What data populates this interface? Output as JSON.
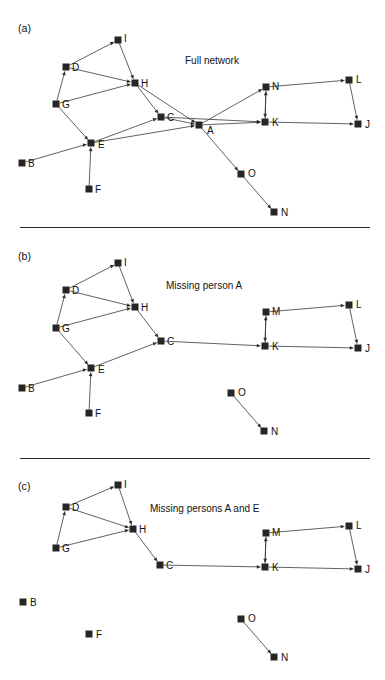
{
  "figure": {
    "width": 385,
    "height": 680,
    "background": "#ffffff",
    "ink_color": "#262626",
    "edge_color": "#2d2d2d"
  },
  "dividers": [
    {
      "name": "divider-a-b",
      "x": 20,
      "y": 227,
      "width": 350
    },
    {
      "name": "divider-b-c",
      "x": 20,
      "y": 458,
      "width": 350
    }
  ],
  "panels": [
    {
      "id": "a",
      "label": "(a)",
      "title": "Full network",
      "label_x": 18,
      "label_y": 22,
      "title_x": 185,
      "title_y": 55,
      "origin_y": 0,
      "nodes": [
        {
          "id": "I",
          "label": "I",
          "x": 118,
          "y": 40,
          "lx": 124,
          "ly": 39
        },
        {
          "id": "D",
          "label": "D",
          "x": 66,
          "y": 67,
          "lx": 72,
          "ly": 68
        },
        {
          "id": "H",
          "label": "H",
          "x": 135,
          "y": 83,
          "lx": 141,
          "ly": 84
        },
        {
          "id": "G",
          "label": "G",
          "x": 56,
          "y": 104,
          "lx": 62,
          "ly": 105
        },
        {
          "id": "C",
          "label": "C",
          "x": 161,
          "y": 117,
          "lx": 167,
          "ly": 118
        },
        {
          "id": "A",
          "label": "A",
          "x": 199,
          "y": 125,
          "lx": 207,
          "ly": 131
        },
        {
          "id": "N1",
          "label": "N",
          "x": 266,
          "y": 87,
          "lx": 272,
          "ly": 87
        },
        {
          "id": "K",
          "label": "K",
          "x": 265,
          "y": 122,
          "lx": 272,
          "ly": 123
        },
        {
          "id": "L",
          "label": "L",
          "x": 349,
          "y": 80,
          "lx": 356,
          "ly": 80
        },
        {
          "id": "J",
          "label": "J",
          "x": 358,
          "y": 124,
          "lx": 365,
          "ly": 125
        },
        {
          "id": "E",
          "label": "E",
          "x": 91,
          "y": 143,
          "lx": 98,
          "ly": 145
        },
        {
          "id": "B",
          "label": "B",
          "x": 22,
          "y": 163,
          "lx": 28,
          "ly": 164
        },
        {
          "id": "F",
          "label": "F",
          "x": 89,
          "y": 189,
          "lx": 95,
          "ly": 190
        },
        {
          "id": "O",
          "label": "O",
          "x": 241,
          "y": 174,
          "lx": 248,
          "ly": 174
        },
        {
          "id": "N2",
          "label": "N",
          "x": 274,
          "y": 212,
          "lx": 281,
          "ly": 213
        }
      ],
      "edges": [
        {
          "from": "D",
          "to": "I",
          "arrow": true
        },
        {
          "from": "I",
          "to": "H",
          "arrow": true
        },
        {
          "from": "D",
          "to": "H",
          "arrow": true
        },
        {
          "from": "G",
          "to": "D",
          "arrow": true
        },
        {
          "from": "G",
          "to": "H",
          "arrow": true
        },
        {
          "from": "H",
          "to": "C",
          "arrow": true
        },
        {
          "from": "H",
          "to": "A",
          "arrow": true
        },
        {
          "from": "C",
          "to": "A",
          "arrow": true
        },
        {
          "from": "G",
          "to": "E",
          "arrow": true
        },
        {
          "from": "B",
          "to": "E",
          "arrow": true
        },
        {
          "from": "F",
          "to": "E",
          "arrow": true
        },
        {
          "from": "E",
          "to": "C",
          "arrow": true
        },
        {
          "from": "E",
          "to": "A",
          "arrow": true
        },
        {
          "from": "A",
          "to": "N1",
          "arrow": true
        },
        {
          "from": "A",
          "to": "K",
          "arrow": true
        },
        {
          "from": "C",
          "to": "K",
          "arrow": true
        },
        {
          "from": "N1",
          "to": "K",
          "arrow": true
        },
        {
          "from": "K",
          "to": "N1",
          "arrow": true
        },
        {
          "from": "N1",
          "to": "L",
          "arrow": true
        },
        {
          "from": "L",
          "to": "J",
          "arrow": true
        },
        {
          "from": "K",
          "to": "J",
          "arrow": true
        },
        {
          "from": "A",
          "to": "O",
          "arrow": true
        },
        {
          "from": "O",
          "to": "N2",
          "arrow": true
        }
      ]
    },
    {
      "id": "b",
      "label": "(b)",
      "title": "Missing person A",
      "label_x": 18,
      "label_y": 250,
      "title_x": 166,
      "title_y": 280,
      "origin_y": 230,
      "nodes": [
        {
          "id": "I",
          "label": "I",
          "x": 118,
          "y": 263,
          "lx": 124,
          "ly": 263
        },
        {
          "id": "D",
          "label": "D",
          "x": 66,
          "y": 290,
          "lx": 72,
          "ly": 291
        },
        {
          "id": "H",
          "label": "H",
          "x": 135,
          "y": 307,
          "lx": 141,
          "ly": 308
        },
        {
          "id": "G",
          "label": "G",
          "x": 56,
          "y": 328,
          "lx": 62,
          "ly": 329
        },
        {
          "id": "C",
          "label": "C",
          "x": 161,
          "y": 341,
          "lx": 167,
          "ly": 342
        },
        {
          "id": "M",
          "label": "M",
          "x": 266,
          "y": 312,
          "lx": 272,
          "ly": 312
        },
        {
          "id": "K",
          "label": "K",
          "x": 265,
          "y": 346,
          "lx": 272,
          "ly": 347
        },
        {
          "id": "L",
          "label": "L",
          "x": 349,
          "y": 305,
          "lx": 356,
          "ly": 305
        },
        {
          "id": "J",
          "label": "J",
          "x": 358,
          "y": 348,
          "lx": 365,
          "ly": 349
        },
        {
          "id": "E",
          "label": "E",
          "x": 91,
          "y": 368,
          "lx": 98,
          "ly": 370
        },
        {
          "id": "B",
          "label": "B",
          "x": 22,
          "y": 388,
          "lx": 28,
          "ly": 389
        },
        {
          "id": "F",
          "label": "F",
          "x": 89,
          "y": 413,
          "lx": 95,
          "ly": 414
        },
        {
          "id": "O",
          "label": "O",
          "x": 231,
          "y": 393,
          "lx": 238,
          "ly": 393
        },
        {
          "id": "N",
          "label": "N",
          "x": 264,
          "y": 431,
          "lx": 271,
          "ly": 432
        }
      ],
      "edges": [
        {
          "from": "D",
          "to": "I",
          "arrow": true
        },
        {
          "from": "I",
          "to": "H",
          "arrow": true
        },
        {
          "from": "D",
          "to": "H",
          "arrow": true
        },
        {
          "from": "G",
          "to": "D",
          "arrow": true
        },
        {
          "from": "G",
          "to": "H",
          "arrow": true
        },
        {
          "from": "H",
          "to": "C",
          "arrow": true
        },
        {
          "from": "G",
          "to": "E",
          "arrow": true
        },
        {
          "from": "B",
          "to": "E",
          "arrow": true
        },
        {
          "from": "F",
          "to": "E",
          "arrow": true
        },
        {
          "from": "E",
          "to": "C",
          "arrow": true
        },
        {
          "from": "C",
          "to": "K",
          "arrow": true
        },
        {
          "from": "M",
          "to": "K",
          "arrow": true
        },
        {
          "from": "K",
          "to": "M",
          "arrow": true
        },
        {
          "from": "M",
          "to": "L",
          "arrow": true
        },
        {
          "from": "L",
          "to": "J",
          "arrow": true
        },
        {
          "from": "K",
          "to": "J",
          "arrow": true
        },
        {
          "from": "O",
          "to": "N",
          "arrow": true
        }
      ]
    },
    {
      "id": "c",
      "label": "(c)",
      "title": "Missing persons A and E",
      "label_x": 18,
      "label_y": 480,
      "title_x": 150,
      "title_y": 503,
      "origin_y": 460,
      "nodes": [
        {
          "id": "I",
          "label": "I",
          "x": 118,
          "y": 485,
          "lx": 124,
          "ly": 485
        },
        {
          "id": "D",
          "label": "D",
          "x": 66,
          "y": 507,
          "lx": 72,
          "ly": 508
        },
        {
          "id": "H",
          "label": "H",
          "x": 133,
          "y": 529,
          "lx": 139,
          "ly": 530
        },
        {
          "id": "G",
          "label": "G",
          "x": 56,
          "y": 548,
          "lx": 62,
          "ly": 549
        },
        {
          "id": "C",
          "label": "C",
          "x": 160,
          "y": 565,
          "lx": 166,
          "ly": 566
        },
        {
          "id": "M",
          "label": "M",
          "x": 266,
          "y": 533,
          "lx": 272,
          "ly": 533
        },
        {
          "id": "K",
          "label": "K",
          "x": 265,
          "y": 567,
          "lx": 272,
          "ly": 568
        },
        {
          "id": "L",
          "label": "L",
          "x": 349,
          "y": 526,
          "lx": 356,
          "ly": 526
        },
        {
          "id": "J",
          "label": "J",
          "x": 358,
          "y": 569,
          "lx": 365,
          "ly": 570
        },
        {
          "id": "B",
          "label": "B",
          "x": 23,
          "y": 602,
          "lx": 30,
          "ly": 603
        },
        {
          "id": "F",
          "label": "F",
          "x": 89,
          "y": 634,
          "lx": 96,
          "ly": 635
        },
        {
          "id": "O",
          "label": "O",
          "x": 241,
          "y": 619,
          "lx": 248,
          "ly": 619
        },
        {
          "id": "N",
          "label": "N",
          "x": 274,
          "y": 657,
          "lx": 281,
          "ly": 658
        }
      ],
      "edges": [
        {
          "from": "D",
          "to": "I",
          "arrow": true
        },
        {
          "from": "I",
          "to": "H",
          "arrow": true
        },
        {
          "from": "D",
          "to": "H",
          "arrow": true
        },
        {
          "from": "G",
          "to": "D",
          "arrow": true
        },
        {
          "from": "G",
          "to": "H",
          "arrow": true
        },
        {
          "from": "H",
          "to": "C",
          "arrow": true
        },
        {
          "from": "C",
          "to": "K",
          "arrow": true
        },
        {
          "from": "M",
          "to": "K",
          "arrow": true
        },
        {
          "from": "K",
          "to": "M",
          "arrow": true
        },
        {
          "from": "M",
          "to": "L",
          "arrow": true
        },
        {
          "from": "L",
          "to": "J",
          "arrow": true
        },
        {
          "from": "K",
          "to": "J",
          "arrow": true
        },
        {
          "from": "O",
          "to": "N",
          "arrow": true
        }
      ]
    }
  ]
}
